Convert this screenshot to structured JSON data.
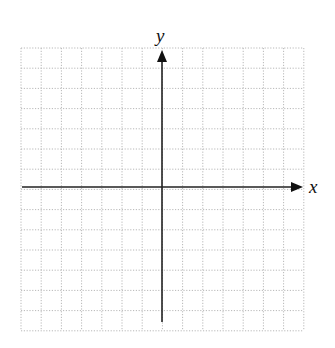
{
  "diagram": {
    "type": "cartesian-coordinate-grid",
    "grid": {
      "left": 21,
      "top": 48,
      "columns": 14,
      "rows": 14,
      "cell_size": 20.2,
      "line_color": "#b8b8b8",
      "line_style": "dotted"
    },
    "axes": {
      "color": "#222222",
      "x_axis": {
        "label": "x",
        "y": 187,
        "x_start": 22,
        "x_end": 303,
        "arrow": "right"
      },
      "y_axis": {
        "label": "y",
        "x": 162,
        "y_start": 322,
        "y_end": 50,
        "arrow": "up"
      }
    }
  }
}
